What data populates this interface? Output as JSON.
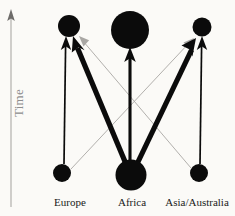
{
  "figure": {
    "title": "",
    "background_color": "#fbfaf7",
    "width": 235,
    "height": 216
  },
  "axis": {
    "time_label": "Time",
    "direction": "upward",
    "color": "#bcbab7"
  },
  "columns": [
    {
      "id": "europe",
      "label": "Europe",
      "x": 69,
      "label_x": 38,
      "label_width": 64
    },
    {
      "id": "africa",
      "label": "Africa",
      "x": 130,
      "label_x": 104,
      "label_width": 56
    },
    {
      "id": "asia_australia",
      "label": "Asia/Australia",
      "x": 201,
      "label_x": 158,
      "label_width": 78
    }
  ],
  "nodes": [
    {
      "id": "europe-present",
      "column": "europe",
      "period": "present",
      "cx": 69,
      "cy": 26,
      "r": 11,
      "color": "#0b0b0b"
    },
    {
      "id": "africa-present",
      "column": "africa",
      "period": "present",
      "cx": 130,
      "cy": 30,
      "r": 19,
      "color": "#0b0b0b"
    },
    {
      "id": "asia-present",
      "column": "asia_australia",
      "period": "present",
      "cx": 202,
      "cy": 27,
      "r": 9.5,
      "color": "#0b0b0b"
    },
    {
      "id": "europe-past",
      "column": "europe",
      "period": "past",
      "cx": 62,
      "cy": 173,
      "r": 9,
      "color": "#0b0b0b"
    },
    {
      "id": "africa-past",
      "column": "africa",
      "period": "past",
      "cx": 131,
      "cy": 175,
      "r": 15.5,
      "color": "#0b0b0b"
    },
    {
      "id": "asia-past",
      "column": "asia_australia",
      "period": "past",
      "cx": 199,
      "cy": 173,
      "r": 9,
      "color": "#0b0b0b"
    }
  ],
  "edges": [
    {
      "id": "africa-to-europe",
      "from": "africa-past",
      "to": "europe-present",
      "weight": "thick",
      "stroke_width": 5.0,
      "color": "#0b0b0b",
      "arrowhead": true,
      "x1": 126,
      "y1": 163,
      "x2": 75,
      "y2": 40
    },
    {
      "id": "africa-to-asia",
      "from": "africa-past",
      "to": "asia-present",
      "weight": "thick",
      "stroke_width": 5.0,
      "color": "#0b0b0b",
      "arrowhead": true,
      "x1": 137,
      "y1": 163,
      "x2": 194,
      "y2": 42
    },
    {
      "id": "africa-continuity",
      "from": "africa-past",
      "to": "africa-present",
      "weight": "medium",
      "stroke_width": 3.0,
      "color": "#0b0b0b",
      "arrowhead": true,
      "x1": 130,
      "y1": 161,
      "x2": 130,
      "y2": 53
    },
    {
      "id": "europe-continuity",
      "from": "europe-past",
      "to": "europe-present",
      "weight": "thin",
      "stroke_width": 1.6,
      "color": "#0b0b0b",
      "arrowhead": true,
      "x1": 64,
      "y1": 164,
      "x2": 66,
      "y2": 42
    },
    {
      "id": "asia-continuity",
      "from": "asia-past",
      "to": "asia-present",
      "weight": "thin",
      "stroke_width": 1.6,
      "color": "#0b0b0b",
      "arrowhead": true,
      "x1": 200,
      "y1": 164,
      "x2": 202,
      "y2": 42
    },
    {
      "id": "europe-to-asia",
      "from": "europe-past",
      "to": "asia-present",
      "weight": "faint",
      "stroke_width": 0.9,
      "color": "#a9a7a4",
      "arrowhead": true,
      "x1": 71,
      "y1": 169,
      "x2": 192,
      "y2": 40
    },
    {
      "id": "asia-to-europe",
      "from": "asia-past",
      "to": "europe-present",
      "weight": "faint",
      "stroke_width": 0.9,
      "color": "#a9a7a4",
      "arrowhead": true,
      "x1": 191,
      "y1": 168,
      "x2": 80,
      "y2": 38
    }
  ],
  "legend_note": ""
}
